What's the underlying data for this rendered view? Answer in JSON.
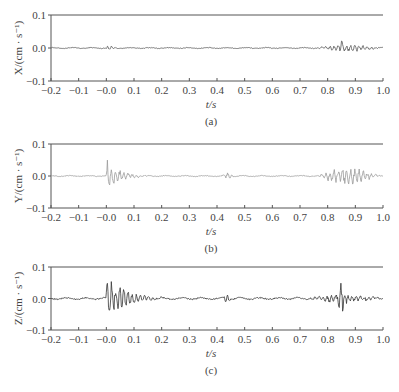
{
  "chart_data": [
    {
      "type": "line",
      "panel_label": "(a)",
      "title": "",
      "xlabel": "t/s",
      "ylabel": "X/(cm · s⁻¹)",
      "xlim": [
        -0.2,
        1.0
      ],
      "ylim": [
        -0.1,
        0.1
      ],
      "xticks": [
        -0.2,
        -0.1,
        0.0,
        0.1,
        0.2,
        0.3,
        0.4,
        0.5,
        0.6,
        0.7,
        0.8,
        0.9,
        1.0
      ],
      "xtick_labels": [
        "−0.2",
        "−0.1",
        "−0.0",
        "0.1",
        "0.2",
        "0.3",
        "0.4",
        "0.5",
        "0.6",
        "0.7",
        "0.8",
        "0.9",
        "1.0"
      ],
      "yticks": [
        -0.1,
        0.0,
        0.1
      ],
      "ytick_labels": [
        "−0.1",
        "0.0",
        "0.1"
      ],
      "grid": false,
      "line_color": "#555555",
      "series": [
        {
          "name": "X velocity",
          "baseline_amplitude": 0.002,
          "bursts": [
            {
              "t_start": 0.0,
              "t_end": 0.07,
              "peak_amplitude": 0.008
            },
            {
              "t_start": 0.76,
              "t_end": 0.99,
              "peak_amplitude": 0.01
            },
            {
              "t_start": 0.84,
              "t_end": 0.86,
              "peak_amplitude": -0.02
            }
          ]
        }
      ]
    },
    {
      "type": "line",
      "panel_label": "(b)",
      "title": "",
      "xlabel": "t/s",
      "ylabel": "Y/(cm · s⁻¹)",
      "xlim": [
        -0.2,
        1.0
      ],
      "ylim": [
        -0.1,
        0.1
      ],
      "xticks": [
        -0.2,
        -0.1,
        0.0,
        0.1,
        0.2,
        0.3,
        0.4,
        0.5,
        0.6,
        0.7,
        0.8,
        0.9,
        1.0
      ],
      "xtick_labels": [
        "−0.2",
        "−0.1",
        "−0.0",
        "0.1",
        "0.2",
        "0.3",
        "0.4",
        "0.5",
        "0.6",
        "0.7",
        "0.8",
        "0.9",
        "1.0"
      ],
      "yticks": [
        -0.1,
        0.0,
        0.1
      ],
      "ytick_labels": [
        "−0.1",
        "0.0",
        "0.1"
      ],
      "grid": false,
      "line_color": "#9a9a9a",
      "series": [
        {
          "name": "Y velocity",
          "baseline_amplitude": 0.002,
          "bursts": [
            {
              "t_start": 0.0,
              "t_end": 0.15,
              "peak_amplitude": 0.05
            },
            {
              "t_start": 0.42,
              "t_end": 0.46,
              "peak_amplitude": 0.01
            },
            {
              "t_start": 0.76,
              "t_end": 0.99,
              "peak_amplitude": 0.025
            }
          ]
        }
      ]
    },
    {
      "type": "line",
      "panel_label": "(c)",
      "title": "",
      "xlabel": "t/s",
      "ylabel": "Z/(cm · s⁻¹)",
      "xlim": [
        -0.2,
        1.0
      ],
      "ylim": [
        -0.1,
        0.1
      ],
      "xticks": [
        -0.2,
        -0.1,
        0.0,
        0.1,
        0.2,
        0.3,
        0.4,
        0.5,
        0.6,
        0.7,
        0.8,
        0.9,
        1.0
      ],
      "xtick_labels": [
        "−0.2",
        "−0.1",
        "−0.0",
        "0.1",
        "0.2",
        "0.3",
        "0.4",
        "0.5",
        "0.6",
        "0.7",
        "0.8",
        "0.9",
        "1.0"
      ],
      "yticks": [
        -0.1,
        0.0,
        0.1
      ],
      "ytick_labels": [
        "−0.1",
        "0.0",
        "0.1"
      ],
      "grid": false,
      "line_color": "#333333",
      "series": [
        {
          "name": "Z velocity",
          "baseline_amplitude": 0.004,
          "bursts": [
            {
              "t_start": 0.0,
              "t_end": 0.2,
              "peak_amplitude": 0.08
            },
            {
              "t_start": 0.42,
              "t_end": 0.45,
              "peak_amplitude": 0.015
            },
            {
              "t_start": 0.72,
              "t_end": 0.99,
              "peak_amplitude": 0.012
            },
            {
              "t_start": 0.83,
              "t_end": 0.87,
              "peak_amplitude": 0.05
            }
          ]
        }
      ]
    }
  ]
}
